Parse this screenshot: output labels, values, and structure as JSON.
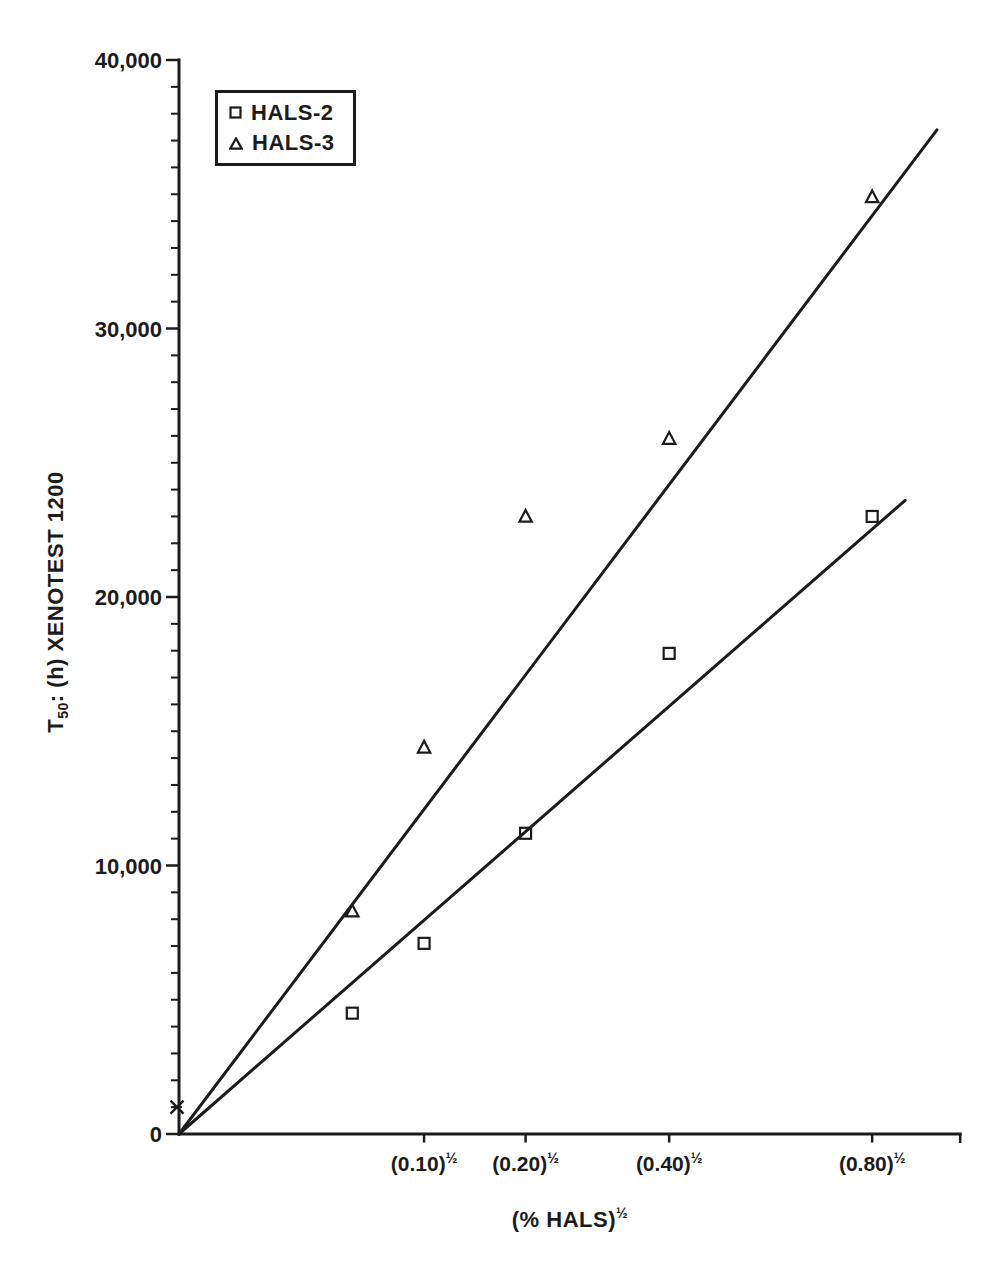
{
  "figure": {
    "background": "#ffffff",
    "ink_color": "#1c1c1c"
  },
  "legend": {
    "items": [
      {
        "marker": "square",
        "label": "HALS-2"
      },
      {
        "marker": "triangle",
        "label": "HALS-3"
      }
    ]
  },
  "chart_data": {
    "type": "scatter",
    "title": "",
    "x_axis": {
      "scale": "sqrt",
      "title_base": "(% HALS)",
      "title_sup": "½",
      "range_sqrt": [
        0,
        1.008
      ],
      "ticks": [
        {
          "conc": 0.1,
          "label_base": "(0.10)",
          "label_sup": "½"
        },
        {
          "conc": 0.2,
          "label_base": "(0.20)",
          "label_sup": "½"
        },
        {
          "conc": 0.4,
          "label_base": "(0.40)",
          "label_sup": "½"
        },
        {
          "conc": 0.8,
          "label_base": "(0.80)",
          "label_sup": "½"
        }
      ]
    },
    "y_axis": {
      "title_prefix": "T",
      "title_sub": "50",
      "title_rest": ": (h) XENOTEST 1200",
      "range": [
        0,
        40000
      ],
      "minor_step": 1000,
      "ticks": [
        {
          "value": 0,
          "label": "0"
        },
        {
          "value": 10000,
          "label": "10,000"
        },
        {
          "value": 20000,
          "label": "20,000"
        },
        {
          "value": 30000,
          "label": "30,000"
        },
        {
          "value": 40000,
          "label": "40,000"
        }
      ]
    },
    "series": [
      {
        "name": "HALS-2",
        "marker": "square",
        "points": [
          {
            "conc": 0.05,
            "t50": 4500
          },
          {
            "conc": 0.1,
            "t50": 7100
          },
          {
            "conc": 0.2,
            "t50": 11200
          },
          {
            "conc": 0.4,
            "t50": 17900
          },
          {
            "conc": 0.8,
            "t50": 23000
          }
        ]
      },
      {
        "name": "HALS-3",
        "marker": "triangle",
        "points": [
          {
            "conc": 0.05,
            "t50": 8300
          },
          {
            "conc": 0.1,
            "t50": 14400
          },
          {
            "conc": 0.2,
            "t50": 23000
          },
          {
            "conc": 0.4,
            "t50": 25900
          },
          {
            "conc": 0.8,
            "t50": 34900
          }
        ]
      }
    ],
    "control_point": {
      "conc": 0.0,
      "t50": 1000,
      "marker": "x"
    },
    "fit_lines": [
      {
        "series": "HALS-2",
        "from": {
          "sqrt_conc": 0.0,
          "t50": 0
        },
        "to": {
          "sqrt_conc": 0.937,
          "t50": 23600
        }
      },
      {
        "series": "HALS-3",
        "from": {
          "sqrt_conc": 0.0,
          "t50": 0
        },
        "to": {
          "sqrt_conc": 0.978,
          "t50": 37400
        }
      }
    ],
    "layout_hints": {
      "grid": false,
      "legend_position": "top-left-inside"
    }
  }
}
